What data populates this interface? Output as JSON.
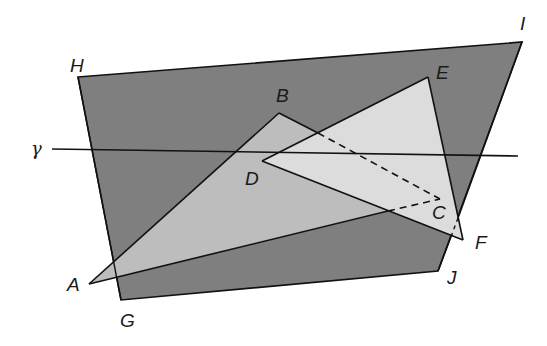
{
  "diagram": {
    "title": "",
    "colors": {
      "plane_fill": "#7f7f7f",
      "triangle_abc_fill": "#bdbdbd",
      "triangle_def_fill": "#dcdcdc",
      "stroke": "#111111",
      "background": "#ffffff"
    },
    "plane": {
      "name": "HIJG",
      "vertices": {
        "H": [
          78,
          77
        ],
        "I": [
          522,
          42
        ],
        "J": [
          438,
          271
        ],
        "G": [
          121,
          300
        ]
      }
    },
    "triangle_abc": {
      "name": "ABC",
      "vertices": {
        "A": [
          89,
          284
        ],
        "B": [
          279,
          113
        ],
        "C": [
          440,
          199
        ]
      }
    },
    "triangle_def": {
      "name": "DEF",
      "vertices": {
        "D": [
          262,
          161
        ],
        "E": [
          428,
          77
        ],
        "F": [
          463,
          240
        ]
      }
    },
    "line_gamma": {
      "name": "γ",
      "from": [
        52,
        149
      ],
      "to": [
        518,
        156
      ]
    },
    "hidden_edges": [
      {
        "name": "BC-hidden",
        "from": [
          318,
          133
        ],
        "to": [
          440,
          199
        ]
      },
      {
        "name": "AC-hidden",
        "from": [
          388,
          211
        ],
        "to": [
          440,
          199
        ]
      },
      {
        "name": "plane-edge-hidden-under-F",
        "from": [
          458,
          218
        ],
        "to": [
          453,
          232
        ]
      }
    ],
    "labels": {
      "H": "H",
      "I": "I",
      "J": "J",
      "G": "G",
      "A": "A",
      "B": "B",
      "C": "C",
      "D": "D",
      "E": "E",
      "F": "F",
      "gamma": "γ"
    }
  }
}
